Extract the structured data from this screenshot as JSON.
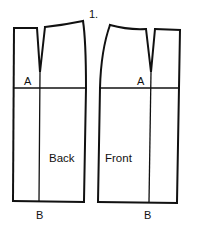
{
  "figure": {
    "number_label": "1.",
    "line_color": "#111111",
    "background": "#ffffff"
  },
  "pieces": {
    "back": {
      "name": "Back",
      "point_a": "A",
      "point_b": "B"
    },
    "front": {
      "name": "Front",
      "point_a": "A",
      "point_b": "B"
    }
  }
}
